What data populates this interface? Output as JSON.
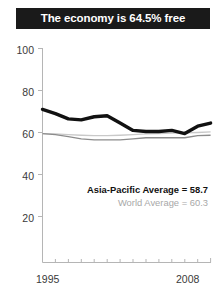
{
  "title": {
    "text": "The economy is 64.5% free"
  },
  "legend": {
    "asia_pacific": "Asia-Pacific Average = 58.7",
    "world": "World Average = 60.3"
  },
  "axis": {
    "y_ticks": [
      "100",
      "80",
      "60",
      "40",
      "20"
    ],
    "x_start": "1995",
    "x_end": "2008"
  },
  "colors": {
    "title_bg": "#1a1a1a",
    "title_fg": "#ffffff",
    "series_country": "#111111",
    "series_asia": "#8c8c8c",
    "series_world": "#c9c9c9",
    "axis": "#b0b0b0"
  },
  "chart_data": {
    "type": "line",
    "title": "The economy is 64.5% free",
    "xlabel": "",
    "ylabel": "",
    "x": [
      1995,
      1996,
      1997,
      1998,
      1999,
      2000,
      2001,
      2002,
      2003,
      2004,
      2005,
      2006,
      2007,
      2008
    ],
    "xlim": [
      1995,
      2008
    ],
    "ylim": [
      0,
      100
    ],
    "yticks": [
      20,
      40,
      60,
      80,
      100
    ],
    "grid": false,
    "legend_position": "inside-right",
    "series": [
      {
        "name": "Country economic freedom score",
        "style": "thick-black",
        "color": "#111111",
        "values": [
          71.0,
          69.0,
          66.5,
          66.0,
          67.5,
          68.0,
          64.5,
          61.0,
          60.5,
          60.5,
          61.0,
          59.5,
          63.0,
          64.5
        ]
      },
      {
        "name": "Asia-Pacific Average",
        "style": "thin-gray",
        "color": "#8c8c8c",
        "average": 58.7,
        "values": [
          59.5,
          59.0,
          58.0,
          57.0,
          56.5,
          56.5,
          56.5,
          57.0,
          57.5,
          57.5,
          57.5,
          57.5,
          58.5,
          58.7
        ]
      },
      {
        "name": "World Average",
        "style": "thin-lightgray",
        "color": "#c9c9c9",
        "average": 60.3,
        "values": [
          59.5,
          59.3,
          59.0,
          58.7,
          58.5,
          58.5,
          58.7,
          59.0,
          59.3,
          59.5,
          59.7,
          59.8,
          60.0,
          60.3
        ]
      }
    ]
  }
}
